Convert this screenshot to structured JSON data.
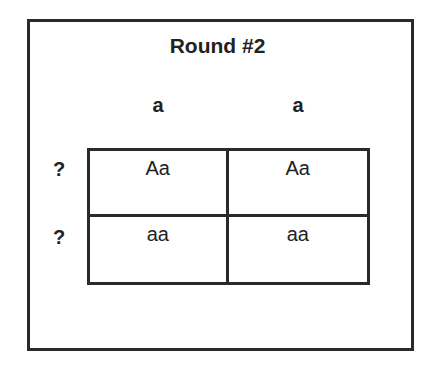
{
  "title": "Round #2",
  "columns": [
    "a",
    "a"
  ],
  "rows": [
    "?",
    "?"
  ],
  "cells": [
    [
      "Aa",
      "Aa"
    ],
    [
      "aa",
      "aa"
    ]
  ]
}
